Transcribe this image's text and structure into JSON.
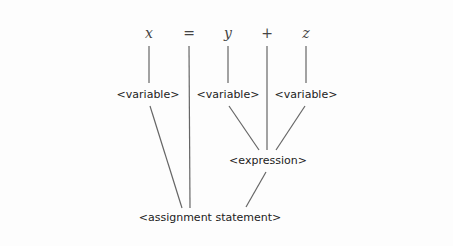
{
  "diagram": {
    "type": "parse-tree",
    "tokens": [
      "x",
      "=",
      "y",
      "+",
      "z"
    ],
    "nodes": {
      "var1": "<variable>",
      "var2": "<variable>",
      "var3": "<variable>",
      "expression": "<expression>",
      "root": "<assignment statement>"
    },
    "edges": [
      [
        "x",
        "var1"
      ],
      [
        "y",
        "var2"
      ],
      [
        "z",
        "var3"
      ],
      [
        "var1",
        "root"
      ],
      [
        "=",
        "root"
      ],
      [
        "var2",
        "expression"
      ],
      [
        "+",
        "expression"
      ],
      [
        "var3",
        "expression"
      ],
      [
        "expression",
        "root"
      ]
    ]
  }
}
